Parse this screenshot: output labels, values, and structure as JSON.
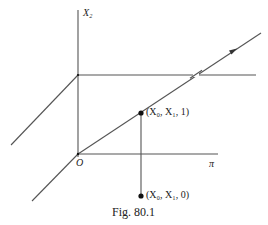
{
  "figure": {
    "caption": "Fig. 80.1",
    "axis_label_vertical": "X₂",
    "origin_label": "O",
    "plane_label": "π",
    "point_upper_label": "(X₀, X₁, 1)",
    "point_lower_label": "(X₀, X₁, 0)"
  },
  "colors": {
    "line": "#555555",
    "text": "#222222",
    "background": "#ffffff"
  }
}
